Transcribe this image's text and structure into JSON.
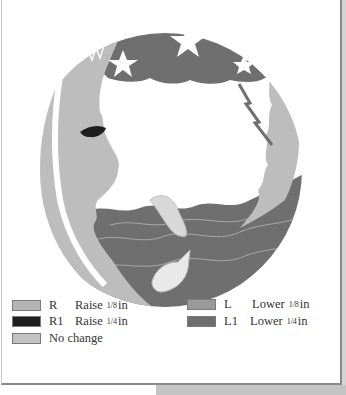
{
  "illustration": {
    "subject": "man-in-the-moon with starry sky, lightning, cloud, dolphin, fish and sea waves",
    "colors": {
      "moon": "#bdbdbd",
      "sky": "#6f6f6f",
      "sea": "#6f6f6f",
      "star": "#ffffff",
      "eye": "#1e1e1e",
      "cloud": "#ffffff"
    }
  },
  "legend": {
    "items": [
      {
        "code": "R",
        "action": "Raise",
        "frac": "1/8",
        "unit": "in",
        "color": "#b5b5b5"
      },
      {
        "code": "R1",
        "action": "Raise",
        "frac": "1/4",
        "unit": "in",
        "color": "#1e1e1e"
      },
      {
        "code": "",
        "action": "No change",
        "frac": "",
        "unit": "",
        "color": "#c2c2c2"
      },
      {
        "code": "L",
        "action": "Lower",
        "frac": "1/8",
        "unit": "in",
        "color": "#9a9a9a"
      },
      {
        "code": "L1",
        "action": "Lower",
        "frac": "1/4",
        "unit": "in",
        "color": "#6e6e6e"
      }
    ]
  }
}
